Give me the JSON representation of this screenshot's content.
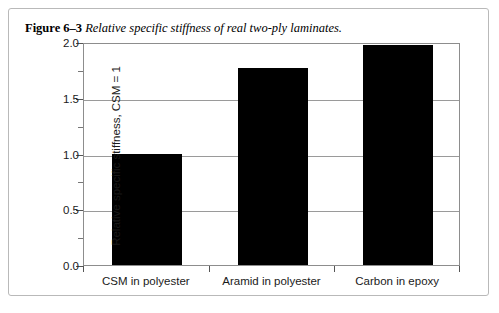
{
  "figure": {
    "label": "Figure 6–3",
    "title": "Relative specific stiffness of real two-ply laminates."
  },
  "chart_data": {
    "type": "bar",
    "title": "Relative specific stiffness of real two-ply laminates.",
    "categories": [
      "CSM in polyester",
      "Aramid in polyester",
      "Carbon in epoxy"
    ],
    "values": [
      1.0,
      1.77,
      1.97
    ],
    "xlabel": "",
    "ylabel": "Relative specific stiffness, CSM = 1",
    "ylim": [
      0.0,
      2.0
    ],
    "ytick_labels": [
      "0.0",
      "0.5",
      "1.0",
      "1.5",
      "2.0"
    ],
    "ytick_values": [
      0.0,
      0.5,
      1.0,
      1.5,
      2.0
    ],
    "yminor_values": [
      0.25,
      0.75,
      1.25,
      1.75
    ],
    "grid": true,
    "legend": false,
    "bar_color": "#000000",
    "grid_color": "#9a9a9a",
    "axis_color": "#8d8d8d"
  }
}
